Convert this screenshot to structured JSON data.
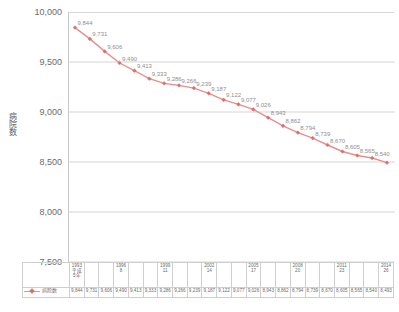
{
  "chart_data": {
    "type": "line",
    "title": "",
    "xlabel": "",
    "ylabel": "病院数",
    "ylim": [
      7500,
      10000
    ],
    "ytick_step": 500,
    "ytick_labels": [
      "10,000",
      "9,500",
      "9,000",
      "8,500",
      "8,000",
      "7,500"
    ],
    "grid": true,
    "legend_position": "bottom-left",
    "line_color": "#e6918f",
    "marker_color": "#d9706e",
    "categories": [
      "1993\n平成\n5年",
      "",
      "",
      "1996\n8",
      "",
      "",
      "1999\n11",
      "",
      "",
      "2002\n14",
      "",
      "",
      "2005\n17",
      "",
      "",
      "2008\n20",
      "",
      "",
      "2011\n23",
      "",
      "",
      "2014\n26"
    ],
    "category_cells": [
      {
        "lines": [
          "1993",
          "平成",
          "5年"
        ]
      },
      {
        "lines": [
          ""
        ]
      },
      {
        "lines": [
          ""
        ]
      },
      {
        "lines": [
          "1996",
          "8"
        ]
      },
      {
        "lines": [
          ""
        ]
      },
      {
        "lines": [
          ""
        ]
      },
      {
        "lines": [
          "1999",
          "11"
        ]
      },
      {
        "lines": [
          ""
        ]
      },
      {
        "lines": [
          ""
        ]
      },
      {
        "lines": [
          "2002",
          "14"
        ]
      },
      {
        "lines": [
          ""
        ]
      },
      {
        "lines": [
          ""
        ]
      },
      {
        "lines": [
          "2005",
          "17"
        ]
      },
      {
        "lines": [
          ""
        ]
      },
      {
        "lines": [
          ""
        ]
      },
      {
        "lines": [
          "2008",
          "20"
        ]
      },
      {
        "lines": [
          ""
        ]
      },
      {
        "lines": [
          ""
        ]
      },
      {
        "lines": [
          "2011",
          "23"
        ]
      },
      {
        "lines": [
          ""
        ]
      },
      {
        "lines": [
          ""
        ]
      },
      {
        "lines": [
          "2014",
          "26"
        ]
      }
    ],
    "series": [
      {
        "name": "病院数",
        "values": [
          9844,
          9731,
          9606,
          9490,
          9413,
          9333,
          9286,
          9266,
          9239,
          9187,
          9122,
          9077,
          9026,
          8943,
          8862,
          8794,
          8739,
          8670,
          8605,
          8565,
          8540,
          8493
        ],
        "value_labels": [
          "9,844",
          "9,731",
          "9,606",
          "9,490",
          "9,413",
          "9,333",
          "9,286",
          "9,266",
          "9,239",
          "9,187",
          "9,122",
          "9,077",
          "9,026",
          "8,943",
          "8,862",
          "8,794",
          "8,739",
          "8,670",
          "8,605",
          "8,565",
          "8,540",
          "8,493"
        ],
        "labels_shown_on_plot": 21
      }
    ]
  },
  "legend": {
    "series_label": "病院数"
  }
}
